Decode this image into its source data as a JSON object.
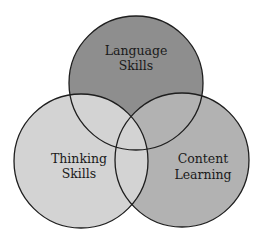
{
  "diagram": {
    "type": "venn",
    "circles": [
      {
        "id": "language",
        "lines": [
          "Language",
          "Skills"
        ],
        "fill": "#8e8e8e",
        "cx": 136,
        "cy": 83,
        "r": 67
      },
      {
        "id": "content",
        "lines": [
          "Content",
          "Learning"
        ],
        "fill": "#b2b2b2",
        "cx": 182,
        "cy": 160,
        "r": 67
      },
      {
        "id": "thinking",
        "lines": [
          "Thinking",
          "Skills"
        ],
        "fill": "#d3d3d3",
        "cx": 81,
        "cy": 161,
        "r": 67
      }
    ],
    "stroke": "#1e1e1e"
  }
}
